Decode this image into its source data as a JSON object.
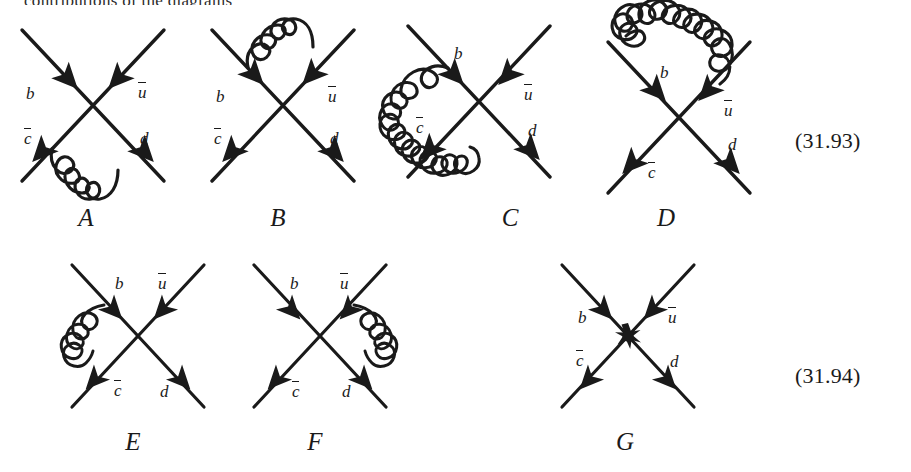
{
  "document": {
    "cut_off_top_line": "contributions of the diagrams",
    "equation_numbers": [
      {
        "id": "eq-93",
        "label": "(31.93)"
      },
      {
        "id": "eq-94",
        "label": "(31.94)"
      }
    ]
  },
  "particles": {
    "b": "b",
    "ubar_base": "u",
    "cbar_base": "c",
    "d": "d"
  },
  "rows": [
    {
      "name": "row-one",
      "equation": "(31.93)",
      "diagrams": [
        {
          "label": "A",
          "name": "diagram-a",
          "gluon": "bottom-arc-between-cbar-and-d",
          "legs": [
            {
              "name": "b",
              "display": "b",
              "bar": false,
              "position": "upper-left"
            },
            {
              "name": "ubar",
              "display": "u",
              "bar": true,
              "position": "upper-right"
            },
            {
              "name": "cbar",
              "display": "c",
              "bar": true,
              "position": "lower-left"
            },
            {
              "name": "d",
              "display": "d",
              "bar": false,
              "position": "lower-right"
            }
          ]
        },
        {
          "label": "B",
          "name": "diagram-b",
          "gluon": "top-arc-between-b-and-ubar",
          "legs": [
            {
              "name": "b",
              "display": "b",
              "bar": false,
              "position": "upper-left"
            },
            {
              "name": "ubar",
              "display": "u",
              "bar": true,
              "position": "upper-right"
            },
            {
              "name": "cbar",
              "display": "c",
              "bar": true,
              "position": "lower-left"
            },
            {
              "name": "d",
              "display": "d",
              "bar": false,
              "position": "lower-right"
            }
          ]
        },
        {
          "label": "C",
          "name": "diagram-c",
          "gluon": "large-loop-left-and-bottom-between-b-and-d",
          "legs": [
            {
              "name": "b",
              "display": "b",
              "bar": false,
              "position": "upper-left"
            },
            {
              "name": "ubar",
              "display": "u",
              "bar": true,
              "position": "upper-right"
            },
            {
              "name": "cbar",
              "display": "c",
              "bar": true,
              "position": "lower-left"
            },
            {
              "name": "d",
              "display": "d",
              "bar": false,
              "position": "lower-right"
            }
          ]
        },
        {
          "label": "D",
          "name": "diagram-d",
          "gluon": "large-loop-top-and-left-between-ubar-and-cbar",
          "legs": [
            {
              "name": "b",
              "display": "b",
              "bar": false,
              "position": "upper-left"
            },
            {
              "name": "ubar",
              "display": "u",
              "bar": true,
              "position": "upper-right"
            },
            {
              "name": "cbar",
              "display": "c",
              "bar": true,
              "position": "lower-left"
            },
            {
              "name": "d",
              "display": "d",
              "bar": false,
              "position": "lower-right"
            }
          ]
        }
      ]
    },
    {
      "name": "row-two",
      "equation": "(31.94)",
      "diagrams": [
        {
          "label": "E",
          "name": "diagram-e",
          "gluon": "left-arc-between-b-and-cbar",
          "legs": [
            {
              "name": "b",
              "display": "b",
              "bar": false,
              "position": "upper-left"
            },
            {
              "name": "ubar",
              "display": "u",
              "bar": true,
              "position": "upper-right"
            },
            {
              "name": "cbar",
              "display": "c",
              "bar": true,
              "position": "lower-left"
            },
            {
              "name": "d",
              "display": "d",
              "bar": false,
              "position": "lower-right"
            }
          ]
        },
        {
          "label": "F",
          "name": "diagram-f",
          "gluon": "right-arc-between-ubar-and-d",
          "legs": [
            {
              "name": "b",
              "display": "b",
              "bar": false,
              "position": "upper-left"
            },
            {
              "name": "ubar",
              "display": "u",
              "bar": true,
              "position": "upper-right"
            },
            {
              "name": "cbar",
              "display": "c",
              "bar": true,
              "position": "lower-left"
            },
            {
              "name": "d",
              "display": "d",
              "bar": false,
              "position": "lower-right"
            }
          ]
        },
        {
          "label": "G",
          "name": "diagram-g",
          "gluon": "none-blob-vertex",
          "legs": [
            {
              "name": "b",
              "display": "b",
              "bar": false,
              "position": "upper-left"
            },
            {
              "name": "ubar",
              "display": "u",
              "bar": true,
              "position": "upper-right"
            },
            {
              "name": "cbar",
              "display": "c",
              "bar": true,
              "position": "lower-left"
            },
            {
              "name": "d",
              "display": "d",
              "bar": false,
              "position": "lower-right"
            }
          ]
        }
      ]
    }
  ],
  "style": {
    "ink": "#1a1a1a",
    "background": "#ffffff"
  }
}
